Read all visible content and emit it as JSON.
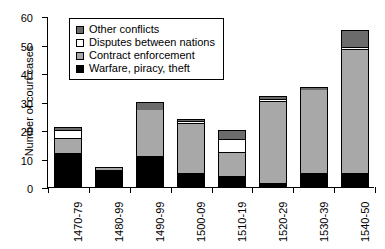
{
  "chart_data": {
    "type": "bar",
    "title": "",
    "xlabel": "",
    "ylabel": "Number of court cases",
    "ylim": [
      0,
      60
    ],
    "yticks": [
      0,
      10,
      20,
      30,
      40,
      50,
      60
    ],
    "grid": false,
    "stacked": true,
    "legend_position": "top-left-inside",
    "categories": [
      "1470-79",
      "1480-99",
      "1490-99",
      "1500-09",
      "1510-19",
      "1520-29",
      "1530-39",
      "1540-50"
    ],
    "series": [
      {
        "name": "Warfare, piracy, theft",
        "color": "#000000",
        "values": [
          12,
          6,
          11,
          5,
          4,
          1.5,
          5,
          5
        ]
      },
      {
        "name": "Contract enforcement",
        "color": "#a8a8a8",
        "values": [
          5,
          0.5,
          16,
          17,
          8,
          28.5,
          29,
          43
        ]
      },
      {
        "name": "Disputes between nations",
        "color": "#ffffff",
        "values": [
          3,
          0,
          0,
          1,
          5,
          1,
          0,
          1
        ]
      },
      {
        "name": "Other conflicts",
        "color": "#6b6b6b",
        "values": [
          1,
          0.5,
          3,
          1,
          3,
          1,
          1,
          6
        ]
      }
    ],
    "totals": [
      21,
      7,
      30,
      24,
      20,
      32,
      35,
      55
    ]
  },
  "legend": {
    "items": [
      {
        "label": "Other conflicts",
        "swatch": "dkgray"
      },
      {
        "label": "Disputes between nations",
        "swatch": "white"
      },
      {
        "label": "Contract enforcement",
        "swatch": "ltgray"
      },
      {
        "label": "Warfare, piracy, theft",
        "swatch": "black"
      }
    ]
  }
}
